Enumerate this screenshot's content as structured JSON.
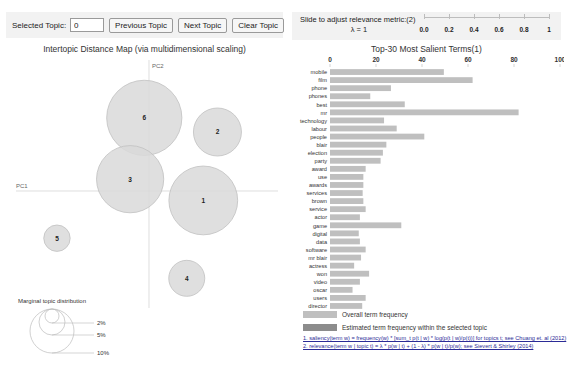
{
  "topic_controls": {
    "selected_topic_label": "Selected Topic:",
    "selected_topic_value": "0",
    "previous_topic": "Previous Topic",
    "next_topic": "Next Topic",
    "clear_topic": "Clear Topic"
  },
  "relevance": {
    "instruction": "Slide to adjust relevance metric:",
    "footnote_marker": "(2)",
    "lambda_label": "λ = 1",
    "lambda_value": 1,
    "ticks": [
      "0.0",
      "0.2",
      "0.4",
      "0.6",
      "0.8",
      "1"
    ],
    "tick_values": [
      0.0,
      0.2,
      0.4,
      0.6,
      0.8,
      1.0
    ]
  },
  "intertopic_map": {
    "title": "Intertopic Distance Map (via multidimensional scaling)",
    "axis_x_label": "PC1",
    "axis_y_label": "PC2",
    "legend_title": "Marginal topic distribution",
    "legend_sizes": [
      "2%",
      "5%",
      "10%"
    ]
  },
  "bar_panel": {
    "title": "Top-30 Most Salient Terms",
    "title_marker": "(1)",
    "legend_overall": "Overall term frequency",
    "legend_estimated": "Estimated term frequency within the selected topic",
    "footnote_1": "1. saliency(term w) = frequency(w) * [sum_t p(t | w) * log(p(t | w)/p(t))] for topics t; see Chuang et. al (2012)",
    "footnote_2": "2. relevance(term w | topic t) = λ * p(w | t) + (1 - λ) * p(w | t)/p(w); see Sievert & Shirley (2014)"
  },
  "colors": {
    "bar_overall": "#bfbfbf",
    "bar_estimated": "#8c8c8c",
    "circle_fill": "#d9d9d9",
    "circle_stroke": "#c0c0c0",
    "panel_bg": "#f2f2f2",
    "axis": "#d0d0d0",
    "text": "#333333",
    "link": "#2b2b96"
  },
  "chart_data": [
    {
      "type": "bar",
      "title": "Top-30 Most Salient Terms",
      "orientation": "horizontal",
      "xlabel": "",
      "ylabel": "",
      "xlim": [
        0,
        100
      ],
      "xticks": [
        0,
        20,
        40,
        60,
        80,
        100
      ],
      "grid": false,
      "legend_position": "bottom",
      "series": [
        {
          "name": "Overall term frequency",
          "color": "#bfbfbf",
          "values": [
            49.5,
            62.0,
            26.5,
            17.5,
            32.5,
            82.0,
            23.5,
            29.0,
            41.0,
            24.5,
            23.0,
            22.0,
            15.5,
            14.5,
            14.5,
            14.2,
            14.5,
            15.5,
            13.0,
            31.0,
            12.5,
            13.0,
            15.5,
            13.5,
            10.5,
            17.0,
            13.0,
            9.8,
            15.5,
            14.0
          ]
        },
        {
          "name": "Estimated term frequency within the selected topic",
          "color": "#8c8c8c",
          "values": [
            0,
            0,
            0,
            0,
            0,
            0,
            0,
            0,
            0,
            0,
            0,
            0,
            0,
            0,
            0,
            0,
            0,
            0,
            0,
            0,
            0,
            0,
            0,
            0,
            0,
            0,
            0,
            0,
            0,
            0
          ]
        }
      ],
      "categories": [
        "mobile",
        "film",
        "phone",
        "phones",
        "best",
        "mr",
        "technology",
        "labour",
        "people",
        "blair",
        "election",
        "party",
        "award",
        "use",
        "awards",
        "services",
        "brown",
        "service",
        "actor",
        "game",
        "digital",
        "data",
        "software",
        "mr blair",
        "actress",
        "won",
        "video",
        "oscar",
        "users",
        "director"
      ]
    },
    {
      "type": "scatter",
      "title": "Intertopic Distance Map (via multidimensional scaling)",
      "xlabel": "PC1",
      "ylabel": "PC2",
      "grid": false,
      "legend_position": "bottom-left",
      "points": [
        {
          "label": "6",
          "x": -0.04,
          "y": 0.62,
          "size": 9.4
        },
        {
          "label": "2",
          "x": 0.58,
          "y": 0.5,
          "size": 6.0
        },
        {
          "label": "3",
          "x": -0.16,
          "y": 0.1,
          "size": 8.4
        },
        {
          "label": "1",
          "x": 0.46,
          "y": -0.08,
          "size": 8.6
        },
        {
          "label": "5",
          "x": -0.78,
          "y": -0.4,
          "size": 3.3
        },
        {
          "label": "4",
          "x": 0.32,
          "y": -0.74,
          "size": 4.5
        }
      ]
    }
  ]
}
